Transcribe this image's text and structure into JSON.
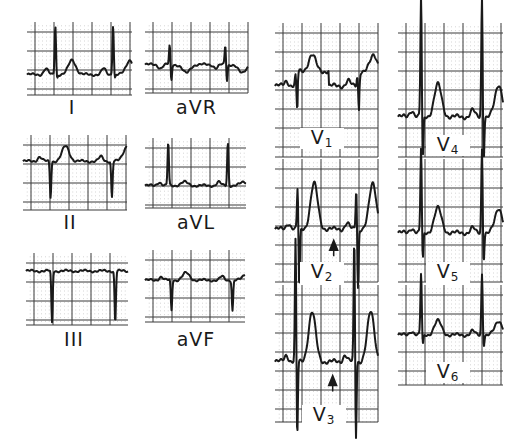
{
  "figure": {
    "colors": {
      "trace": "#1a1a1a",
      "major_grid": "#3a3a3a",
      "minor_dot": "#8a8a8a",
      "background": "#ffffff"
    }
  },
  "leads": [
    {
      "id": "I",
      "label": "I",
      "box": [
        27,
        22,
        105,
        73
      ],
      "label_pos": [
        72,
        98
      ],
      "baseline": 0.72,
      "beats": [
        0.27,
        0.82
      ],
      "shape": {
        "p": 0.08,
        "q": 0.0,
        "r": 0.68,
        "s": -0.06,
        "t": 0.2,
        "st": 0.0
      }
    },
    {
      "id": "aVR",
      "label": "aVR",
      "box": [
        145,
        22,
        103,
        71
      ],
      "label_pos": [
        196,
        98
      ],
      "baseline": 0.6,
      "beats": [
        0.24,
        0.78
      ],
      "shape": {
        "p": -0.05,
        "q": 0.0,
        "r": 0.28,
        "s": -0.24,
        "t": -0.12,
        "st": 0.0
      }
    },
    {
      "id": "II",
      "label": "II",
      "box": [
        23,
        135,
        104,
        75
      ],
      "label_pos": [
        70,
        213
      ],
      "baseline": 0.35,
      "beats": [
        0.25,
        0.84
      ],
      "shape": {
        "p": 0.06,
        "q": 0.0,
        "r": 0.0,
        "s": -0.48,
        "t": 0.2,
        "st": 0.0
      }
    },
    {
      "id": "aVL",
      "label": "aVL",
      "box": [
        145,
        138,
        101,
        70
      ],
      "label_pos": [
        196,
        213
      ],
      "baseline": 0.68,
      "beats": [
        0.23,
        0.82
      ],
      "shape": {
        "p": 0.05,
        "q": 0.0,
        "r": 0.62,
        "s": 0.0,
        "t": 0.05,
        "st": 0.0
      }
    },
    {
      "id": "III",
      "label": "III",
      "box": [
        26,
        253,
        102,
        72
      ],
      "label_pos": [
        74,
        330
      ],
      "baseline": 0.25,
      "beats": [
        0.24,
        0.86
      ],
      "shape": {
        "p": 0.0,
        "q": 0.0,
        "r": 0.0,
        "s": -0.72,
        "t": 0.0,
        "st": 0.0
      }
    },
    {
      "id": "aVF",
      "label": "aVF",
      "box": [
        145,
        250,
        100,
        72
      ],
      "label_pos": [
        196,
        330
      ],
      "baseline": 0.42,
      "beats": [
        0.25,
        0.86
      ],
      "shape": {
        "p": 0.05,
        "q": 0.0,
        "r": 0.0,
        "s": -0.42,
        "t": 0.1,
        "st": 0.0
      }
    },
    {
      "id": "V1",
      "label": "V",
      "sub": "1",
      "box": [
        275,
        23,
        103,
        134
      ],
      "label_pos": [
        320,
        128
      ],
      "baseline": 0.47,
      "beats": [
        0.2,
        0.8
      ],
      "shape": {
        "p": 0.04,
        "q": 0.0,
        "r": 0.08,
        "s": -0.18,
        "t": 0.12,
        "st": 0.11
      }
    },
    {
      "id": "V2",
      "label": "V",
      "sub": "2",
      "box": [
        275,
        159,
        103,
        123
      ],
      "label_pos": [
        320,
        262
      ],
      "baseline": 0.57,
      "beats": [
        0.22,
        0.79
      ],
      "shape": {
        "p": 0.05,
        "q": 0.0,
        "r": 0.35,
        "s": -0.5,
        "t": 0.37,
        "st": 0.0
      },
      "arrow": {
        "x": 0.57,
        "y": 0.66
      }
    },
    {
      "id": "V3",
      "label": "V",
      "sub": "3",
      "box": [
        275,
        285,
        103,
        137
      ],
      "label_pos": [
        322,
        405
      ],
      "baseline": 0.56,
      "beats": [
        0.2,
        0.77
      ],
      "shape": {
        "p": 0.05,
        "q": 0.0,
        "r": 0.92,
        "s": -0.6,
        "t": 0.36,
        "st": 0.0
      },
      "arrow": {
        "x": 0.56,
        "y": 0.66
      }
    },
    {
      "id": "V4",
      "label": "V",
      "sub": "4",
      "box": [
        398,
        23,
        105,
        134
      ],
      "label_pos": [
        446,
        135
      ],
      "baseline": 0.7,
      "beats": [
        0.22,
        0.8
      ],
      "shape": {
        "p": 0.05,
        "q": 0.0,
        "r": 0.92,
        "s": -0.35,
        "t": 0.24,
        "st": 0.0
      }
    },
    {
      "id": "V5",
      "label": "V",
      "sub": "5",
      "box": [
        398,
        159,
        105,
        123
      ],
      "label_pos": [
        446,
        262
      ],
      "baseline": 0.6,
      "beats": [
        0.22,
        0.8
      ],
      "shape": {
        "p": 0.04,
        "q": 0.0,
        "r": 0.7,
        "s": -0.25,
        "t": 0.2,
        "st": 0.0
      }
    },
    {
      "id": "V6",
      "label": "V",
      "sub": "6",
      "box": [
        398,
        285,
        105,
        100
      ],
      "label_pos": [
        446,
        362
      ],
      "baseline": 0.5,
      "beats": [
        0.22,
        0.8
      ],
      "shape": {
        "p": 0.04,
        "q": 0.0,
        "r": 0.62,
        "s": -0.12,
        "t": 0.14,
        "st": 0.0
      }
    }
  ]
}
